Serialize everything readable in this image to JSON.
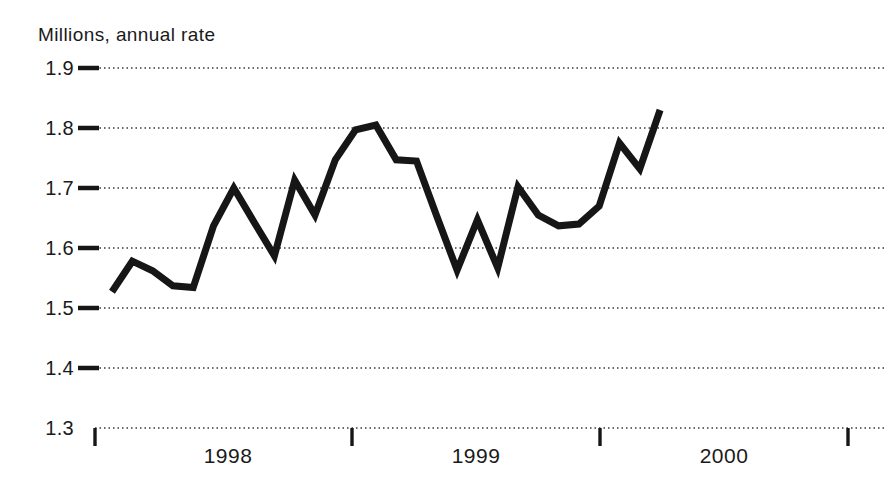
{
  "chart_data": {
    "type": "line",
    "title": "",
    "subtitle": "",
    "ylabel": "Millions, annual rate",
    "xlabel": "",
    "ylim": [
      1.3,
      1.9
    ],
    "ytick_values": [
      1.9,
      1.8,
      1.7,
      1.6,
      1.5,
      1.4,
      1.3
    ],
    "ytick_labels": [
      "1.9",
      "1.8",
      "1.7",
      "1.6",
      "1.5",
      "1.4",
      "1.3"
    ],
    "xtick_labels": [
      "1998",
      "1999",
      "2000"
    ],
    "grid": "horizontal-dotted",
    "legend": "none",
    "line_color": "#161616",
    "line_width": 7,
    "series": [
      {
        "name": "Housing starts",
        "x": [
          "1997-11",
          "1997-12",
          "1998-01",
          "1998-02",
          "1998-03",
          "1998-04",
          "1998-05",
          "1998-06",
          "1998-07",
          "1998-08",
          "1998-09",
          "1998-10",
          "1998-11",
          "1998-12",
          "1999-01",
          "1999-02",
          "1999-03",
          "1999-04",
          "1999-05",
          "1999-06",
          "1999-07",
          "1999-08",
          "1999-09",
          "1999-10",
          "1999-11",
          "1999-12",
          "2000-01",
          "2000-02"
        ],
        "values": [
          1.527,
          1.578,
          1.562,
          1.537,
          1.534,
          1.637,
          1.7,
          1.643,
          1.587,
          1.713,
          1.655,
          1.747,
          1.797,
          1.805,
          1.747,
          1.745,
          1.653,
          1.563,
          1.647,
          1.567,
          1.702,
          1.655,
          1.637,
          1.64,
          1.67,
          1.775,
          1.732,
          1.83
        ]
      }
    ],
    "annotations": []
  },
  "axis": {
    "y_title": "Millions, annual rate",
    "y_ticks": [
      "1.9",
      "1.8",
      "1.7",
      "1.6",
      "1.5",
      "1.4",
      "1.3"
    ],
    "x_ticks": [
      "1998",
      "1999",
      "2000"
    ]
  }
}
